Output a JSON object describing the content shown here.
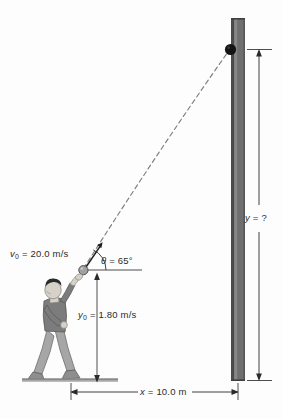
{
  "figure": {
    "background_color": "#fdfdfd"
  },
  "labels": {
    "initial_speed": "v0 = 20.0 m/s",
    "initial_speed_symbol": "v",
    "initial_speed_sub": "0",
    "initial_speed_value": " = 20.0 m/s",
    "angle": "θ = 65°",
    "angle_symbol": "θ",
    "angle_value": " = 65°",
    "initial_height_symbol": "y",
    "initial_height_sub": "0",
    "initial_height_value": " = 1.80 m/s",
    "horizontal_distance_symbol": "x",
    "horizontal_distance_value": " = 10.0 m",
    "unknown_height_symbol": "y",
    "unknown_height_value": " = ?"
  },
  "physics": {
    "initial_speed_magnitude": 20.0,
    "initial_speed_units": "m/s",
    "launch_angle_degrees": 65,
    "initial_height": 1.8,
    "initial_height_units_shown": "m/s",
    "horizontal_distance": 10.0,
    "horizontal_distance_units": "m",
    "unknown": "y"
  },
  "colors": {
    "wall_face": "#6e6e6e",
    "wall_edge": "#4a4a4a",
    "wall_highlight": "#8d8d8d",
    "ground": "#8a8a8a",
    "trajectory": "#7d7d7d",
    "ball_launch": "#9c9c9c",
    "ball_impact": "#161616",
    "person_shirt": "#7b7b7b",
    "person_pants": "#a5a5a5",
    "person_hair": "#2a2a2a",
    "person_skin": "#d8d4cc",
    "dimension_line": "#3a3a3a",
    "text": "#2b2b2b"
  },
  "elements": {
    "wall_name": "vertical wall",
    "ball_impact_name": "ball at wall",
    "ball_launch_name": "ball at launch",
    "person_name": "person throwing ball",
    "trajectory_name": "dashed parabolic trajectory",
    "ground_name": "ground line"
  }
}
